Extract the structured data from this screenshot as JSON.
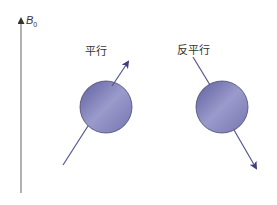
{
  "axis": {
    "label": "B",
    "subscript": "0"
  },
  "spins": [
    {
      "label": "平行",
      "direction": "up-right"
    },
    {
      "label": "反平行",
      "direction": "down-right"
    }
  ],
  "colors": {
    "sphere_dark": "#6a6aa8",
    "sphere_light": "#b8b8dc",
    "arrow": "#4a4a8a",
    "axis": "#777777"
  }
}
